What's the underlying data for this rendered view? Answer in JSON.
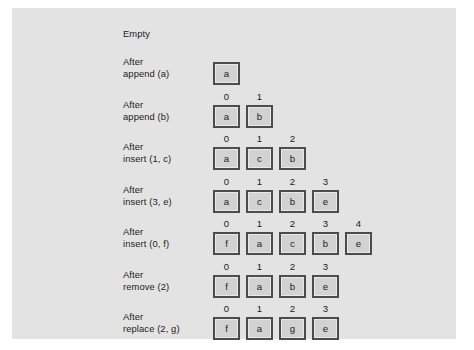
{
  "figure": {
    "background_color": "#e3e3e3",
    "page_background_color": "#ffffff",
    "cell_fill_color": "#d2d2d2",
    "cell_border_color": "#4c4c4c",
    "text_color": "#1c1c1c"
  },
  "rows": [
    {
      "label": "Empty",
      "indices": [],
      "values": []
    },
    {
      "label": "After\nappend (a)",
      "indices": [],
      "values": [
        "a"
      ]
    },
    {
      "label": "After\nappend (b)",
      "indices": [
        "0",
        "1"
      ],
      "values": [
        "a",
        "b"
      ]
    },
    {
      "label": "After\ninsert (1, c)",
      "indices": [
        "0",
        "1",
        "2"
      ],
      "values": [
        "a",
        "c",
        "b"
      ]
    },
    {
      "label": "After\ninsert (3, e)",
      "indices": [
        "0",
        "1",
        "2",
        "3"
      ],
      "values": [
        "a",
        "c",
        "b",
        "e"
      ]
    },
    {
      "label": "After\ninsert (0, f)",
      "indices": [
        "0",
        "1",
        "2",
        "3",
        "4"
      ],
      "values": [
        "f",
        "a",
        "c",
        "b",
        "e"
      ]
    },
    {
      "label": "After\nremove (2)",
      "indices": [
        "0",
        "1",
        "2",
        "3"
      ],
      "values": [
        "f",
        "a",
        "b",
        "e"
      ]
    },
    {
      "label": "After\nreplace (2, g)",
      "indices": [
        "0",
        "1",
        "2",
        "3"
      ],
      "values": [
        "f",
        "a",
        "g",
        "e"
      ]
    }
  ]
}
